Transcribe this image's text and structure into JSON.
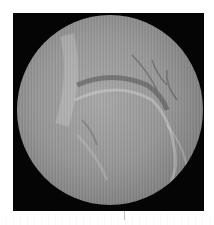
{
  "image": {
    "kind": "grayscale circular field-of-view medical image",
    "colors": {
      "background": "#ffffff",
      "frame": "#050505",
      "field_center": "#a8a8a8",
      "field_edge": "#3a3a3a"
    }
  }
}
